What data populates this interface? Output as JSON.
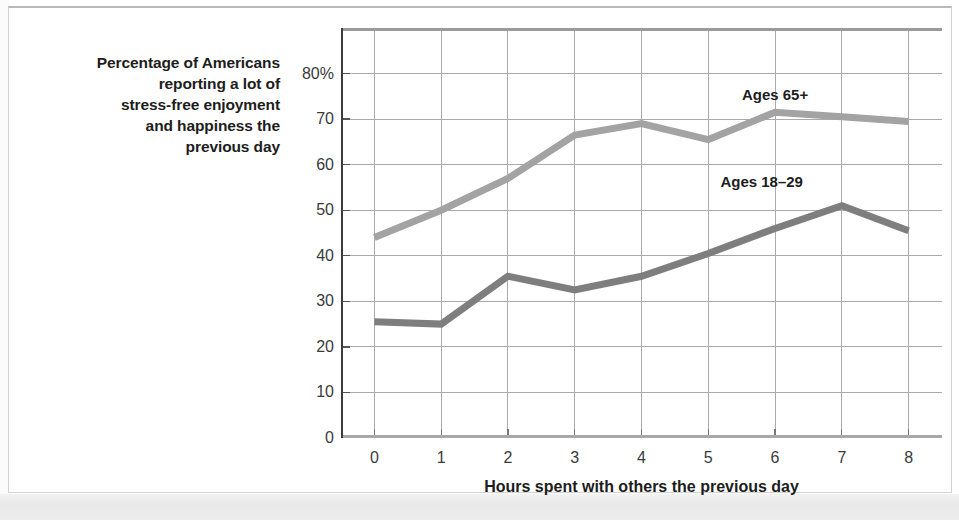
{
  "figure": {
    "y_caption": "Percentage of Americans reporting a lot of stress-free enjoyment and happiness the previous day",
    "y_caption_lines": [
      "Percentage of Americans",
      "reporting a lot of",
      "stress-free enjoyment",
      "and happiness the",
      "previous day"
    ],
    "x_caption": "Hours spent with others the previous day"
  },
  "chart_data": {
    "type": "line",
    "title": "",
    "subtitle": "",
    "xlabel": "Hours spent with others the previous day",
    "ylabel": "Percentage of Americans reporting a lot of stress-free enjoyment and happiness the previous day",
    "x": [
      0,
      1,
      2,
      3,
      4,
      5,
      6,
      7,
      8
    ],
    "xtick_labels": [
      "0",
      "1",
      "2",
      "3",
      "4",
      "5",
      "6",
      "7",
      "8"
    ],
    "xlim": [
      -0.5,
      8.5
    ],
    "ylim": [
      0,
      90
    ],
    "ytick_values": [
      0,
      10,
      20,
      30,
      40,
      50,
      60,
      70,
      80
    ],
    "ytick_labels": [
      "0",
      "10",
      "20",
      "30",
      "40",
      "50",
      "60",
      "70",
      "80%"
    ],
    "grid": true,
    "grid_color": "#aaaaaa",
    "legend_position": "inline-annotations",
    "series": [
      {
        "name": "Ages 65+",
        "color": "#a3a3a3",
        "label_x": 6.0,
        "label_y": 75.5,
        "values": [
          44,
          50,
          57,
          66.5,
          69,
          65.5,
          71.5,
          70.5,
          69.5
        ]
      },
      {
        "name": "Ages 18–29",
        "color": "#7e7e7e",
        "label_x": 5.8,
        "label_y": 56.5,
        "values": [
          25.5,
          25,
          35.5,
          32.5,
          35.5,
          40.5,
          46,
          51,
          45.5
        ]
      }
    ]
  }
}
